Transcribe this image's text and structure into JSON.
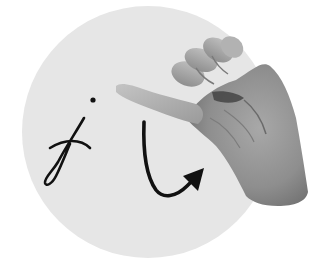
{
  "illustration": {
    "subject": "sign-language-letter-j",
    "letter": "j",
    "motion": "hook-arrow",
    "hand_pose": "pinky-extended",
    "colors": {
      "background": "#ffffff",
      "circle": "#e6e6e6",
      "ink": "#111111",
      "hand_light": "#b9b9b9",
      "hand_mid": "#9a9a9a",
      "hand_dark": "#6e6e6e",
      "hand_shadow": "#3a3a3a"
    }
  }
}
